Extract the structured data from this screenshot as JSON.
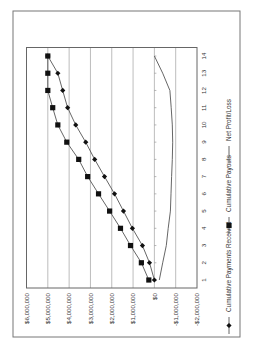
{
  "chart_data": {
    "type": "line",
    "orientation": "rotated-90-clockwise",
    "title": "",
    "xlabel": "",
    "ylabel": "",
    "x": [
      1,
      2,
      3,
      4,
      5,
      6,
      7,
      8,
      9,
      10,
      11,
      12,
      13,
      14
    ],
    "x_tick_labels": [
      "1",
      "2",
      "3",
      "4",
      "5",
      "6",
      "7",
      "8",
      "9",
      "10",
      "11",
      "12",
      "13",
      "14"
    ],
    "y_tick_labels": [
      "-$2,000,000",
      "-$1,000,000",
      "$0",
      "$1,000,000",
      "$2,000,000",
      "$3,000,000",
      "$4,000,000",
      "$5,000,000",
      "$6,000,000"
    ],
    "y_ticks": [
      -2000000,
      -1000000,
      0,
      1000000,
      2000000,
      3000000,
      4000000,
      5000000,
      6000000
    ],
    "ylim": [
      -2000000,
      6000000
    ],
    "grid": "major y gridlines",
    "legend_position": "bottom",
    "series": [
      {
        "name": "Cumulative Payments Received",
        "marker": "diamond",
        "values": [
          0,
          230000,
          560000,
          1030000,
          1450000,
          1870000,
          2340000,
          2800000,
          3220000,
          3690000,
          4070000,
          4300000,
          4530000,
          5000000
        ]
      },
      {
        "name": "Cumulative Payouts",
        "marker": "square",
        "values": [
          260000,
          610000,
          1120000,
          1590000,
          2100000,
          2620000,
          3130000,
          3550000,
          4110000,
          4530000,
          4770000,
          5000000,
          5000000,
          5000000
        ]
      },
      {
        "name": "Net Profit/Loss",
        "marker": "none",
        "values": [
          -230000,
          -390000,
          -560000,
          -650000,
          -750000,
          -780000,
          -810000,
          -840000,
          -860000,
          -840000,
          -790000,
          -730000,
          -390000,
          0
        ]
      }
    ]
  },
  "legend": {
    "items": [
      {
        "label": "Cumulative Payments Received",
        "marker": "diamond"
      },
      {
        "label": "Cumulative Payouts",
        "marker": "square"
      },
      {
        "label": "Net Profit/Loss",
        "marker": "line"
      }
    ]
  },
  "colors": {
    "series_line": "#555555",
    "marker": "#111111",
    "grid": "#bdbdbd",
    "frame": "#777777",
    "text": "#333333"
  }
}
